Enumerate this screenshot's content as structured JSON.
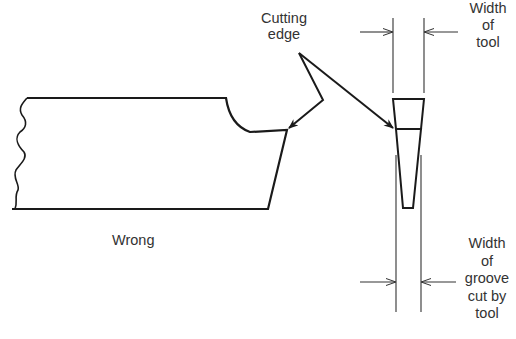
{
  "labels": {
    "cutting_edge": [
      "Cutting",
      "edge"
    ],
    "width_of_tool": [
      "Width",
      "of",
      "tool"
    ],
    "width_of_groove": [
      "Width",
      "of",
      "groove",
      "cut by",
      "tool"
    ],
    "wrong": "Wrong"
  },
  "colors": {
    "stroke": "#1a1a1a",
    "text": "#333333",
    "background": "#ffffff"
  }
}
